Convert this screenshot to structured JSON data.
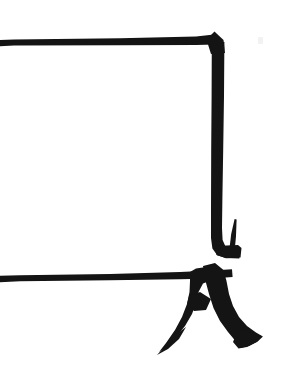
{
  "artwork": {
    "kind": "chinese-calligraphy-glyph",
    "script_style": "kaishu-brush",
    "description": "Cropped brush-written Chinese character fragment: a long horizontal stroke turning into a vertical stroke with hooked foot, a second long horizontal stroke, and the radical you below-right",
    "radical_component": "又",
    "ink_color": "#141414",
    "background_color": "#ffffff",
    "canvas": {
      "width": 282,
      "height": 379
    }
  },
  "strokes": [
    {
      "id": "stroke-1",
      "name": "heng-top",
      "label": "横 (horizontal, top)",
      "order": 1,
      "start": {
        "x": 0,
        "y": 43
      },
      "end": {
        "x": 213,
        "y": 40
      },
      "thickness": 4
    },
    {
      "id": "stroke-2",
      "name": "shu-gou-vertical",
      "label": "竖钩 (vertical with hook)",
      "order": 2,
      "start": {
        "x": 214,
        "y": 38
      },
      "end": {
        "x": 232,
        "y": 252
      },
      "thickness": 11
    },
    {
      "id": "stroke-3",
      "name": "hook-tick",
      "label": "挂针 (small rising tick)",
      "order": 3,
      "start": {
        "x": 234,
        "y": 220
      },
      "end": {
        "x": 229,
        "y": 250
      },
      "thickness": 3
    },
    {
      "id": "stroke-4",
      "name": "heng-bottom",
      "label": "横 (horizontal, bottom)",
      "order": 4,
      "start": {
        "x": 0,
        "y": 279
      },
      "end": {
        "x": 232,
        "y": 273
      },
      "thickness": 4
    },
    {
      "id": "stroke-5",
      "name": "you-heng-pie",
      "label": "横擇 (turning stroke of 又)",
      "order": 5,
      "start": {
        "x": 196,
        "y": 277
      },
      "end": {
        "x": 170,
        "y": 355
      },
      "thickness": 10
    },
    {
      "id": "stroke-6",
      "name": "you-na",
      "label": "捷 (falling right stroke of 又)",
      "order": 6,
      "start": {
        "x": 206,
        "y": 268
      },
      "end": {
        "x": 252,
        "y": 350
      },
      "thickness": 12
    }
  ],
  "accents": [
    {
      "id": "ink-speck",
      "name": "paper-speck",
      "x": 258,
      "y": 37
    }
  ]
}
